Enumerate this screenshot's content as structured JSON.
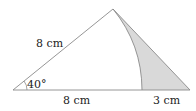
{
  "diagram": {
    "type": "geometry-triangle-with-sector",
    "labels": {
      "left_side": "8 cm",
      "angle": "40°",
      "base_left": "8 cm",
      "base_right": "3 cm"
    },
    "colors": {
      "stroke": "#8a8a8a",
      "shade": "#d9d9d9",
      "text": "#222222"
    }
  }
}
